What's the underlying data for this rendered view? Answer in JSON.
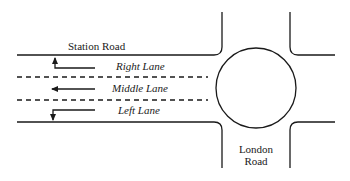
{
  "diagram": {
    "roads": {
      "station_road": "Station Road",
      "london_road_line1": "London",
      "london_road_line2": "Road"
    },
    "lanes": [
      {
        "label": "Right Lane",
        "direction": "left-then-up"
      },
      {
        "label": "Middle Lane",
        "direction": "left"
      },
      {
        "label": "Left Lane",
        "direction": "left-then-down"
      }
    ],
    "junction": "roundabout",
    "stroke_color": "#1a1a1a",
    "background_color": "#ffffff"
  }
}
